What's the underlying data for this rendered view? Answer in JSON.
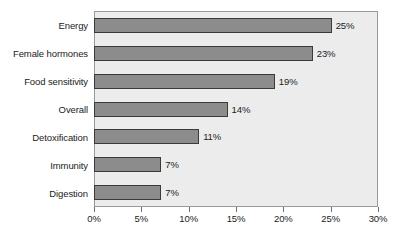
{
  "chart_data": {
    "type": "bar",
    "orientation": "horizontal",
    "title": "",
    "subtitle": "",
    "xlabel": "",
    "ylabel": "",
    "categories": [
      "Energy",
      "Female hormones",
      "Food sensitivity",
      "Overall",
      "Detoxification",
      "Immunity",
      "Digestion"
    ],
    "values": [
      25,
      23,
      19,
      14,
      11,
      7,
      7
    ],
    "value_labels": [
      "25%",
      "23%",
      "19%",
      "14%",
      "11%",
      "7%",
      "7%"
    ],
    "xlim": [
      0,
      30
    ],
    "xticks": [
      0,
      5,
      10,
      15,
      20,
      25,
      30
    ],
    "xtick_labels": [
      "0%",
      "5%",
      "10%",
      "15%",
      "20%",
      "25%",
      "30%"
    ],
    "grid": false,
    "legend": null,
    "legend_position": "none",
    "colors": {
      "bar_fill": "#8c8c8c",
      "bar_border": "#3a3a3a",
      "plot_background": "#ececec",
      "plot_border": "#9a9a9a",
      "figure_background": "#ffffff",
      "text": "#1b1b1b",
      "tick_mark": "#6f6f6f"
    }
  }
}
